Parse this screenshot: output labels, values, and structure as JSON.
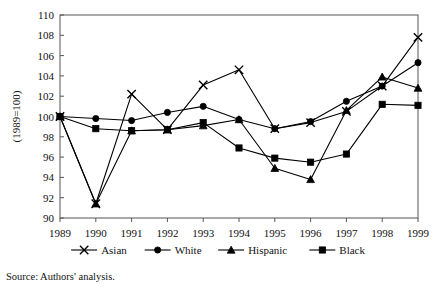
{
  "figure": {
    "clipped_top_text": "",
    "source_note": "Source: Authors' analysis."
  },
  "axes": {
    "y_title": "(1989=100)",
    "y_ticks": [
      "110",
      "108",
      "106",
      "104",
      "102",
      "100",
      "98",
      "96",
      "94",
      "92",
      "90"
    ],
    "x_ticks": [
      "1989",
      "1990",
      "1991",
      "1992",
      "1993",
      "1994",
      "1995",
      "1996",
      "1997",
      "1998",
      "1999"
    ]
  },
  "legend": {
    "items": [
      {
        "label": "Asian",
        "marker": "cross-marker",
        "color": "#000000"
      },
      {
        "label": "White",
        "marker": "circle-marker",
        "color": "#000000"
      },
      {
        "label": "Hispanic",
        "marker": "triangle-marker",
        "color": "#000000"
      },
      {
        "label": "Black",
        "marker": "square-marker",
        "color": "#000000"
      }
    ]
  },
  "chart_data": {
    "type": "line",
    "title": "",
    "xlabel": "",
    "ylabel": "(1989=100)",
    "ylim": [
      90,
      110
    ],
    "ytick_step": 2,
    "grid": false,
    "legend_position": "bottom",
    "x": [
      1989,
      1990,
      1991,
      1992,
      1993,
      1994,
      1995,
      1996,
      1997,
      1998,
      1999
    ],
    "categories": [
      "1989",
      "1990",
      "1991",
      "1992",
      "1993",
      "1994",
      "1995",
      "1996",
      "1997",
      "1998",
      "1999"
    ],
    "series": [
      {
        "name": "Asian",
        "marker": "x",
        "values": [
          100.0,
          91.4,
          102.2,
          98.7,
          103.1,
          104.6,
          98.8,
          99.4,
          100.5,
          103.0,
          107.8
        ]
      },
      {
        "name": "White",
        "marker": "circle",
        "values": [
          100.0,
          99.8,
          99.6,
          100.4,
          101.0,
          99.7,
          98.8,
          99.5,
          101.5,
          103.0,
          105.3
        ]
      },
      {
        "name": "Hispanic",
        "marker": "triangle",
        "values": [
          100.0,
          91.4,
          98.6,
          98.7,
          99.1,
          99.7,
          94.9,
          93.8,
          100.6,
          103.9,
          102.8
        ]
      },
      {
        "name": "Black",
        "marker": "square",
        "values": [
          100.0,
          98.8,
          98.6,
          98.7,
          99.4,
          96.9,
          95.9,
          95.5,
          96.3,
          101.2,
          101.1
        ]
      }
    ]
  }
}
